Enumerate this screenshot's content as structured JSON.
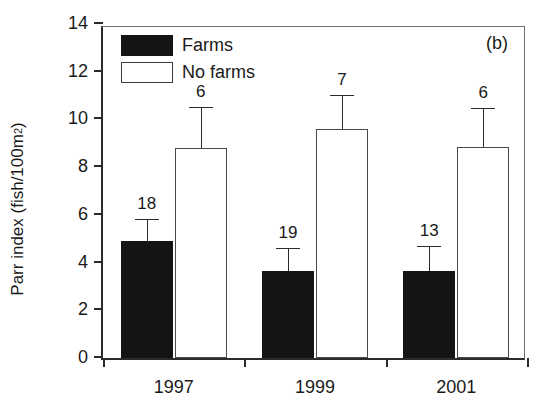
{
  "chart_data": {
    "type": "bar",
    "title": "",
    "panel_label": "(b)",
    "xlabel": "",
    "ylabel": "Parr index (fish/100m",
    "ylabel_sup": "2",
    "ylabel_suffix": ")",
    "categories": [
      "1997",
      "1999",
      "2001"
    ],
    "ylim": [
      0,
      14
    ],
    "yticks": [
      0,
      2,
      4,
      6,
      8,
      10,
      12,
      14
    ],
    "ytick_labels": [
      "0",
      "2",
      "4",
      "6",
      "8",
      "10",
      "12",
      "14"
    ],
    "grid": false,
    "legend_position": "top-left",
    "series": [
      {
        "name": "Farms",
        "color": "#141414",
        "fill": "solid",
        "values": [
          4.9,
          3.65,
          3.65
        ],
        "errors_upper": [
          0.9,
          0.9,
          1.0
        ],
        "sample_sizes": [
          18,
          19,
          13
        ],
        "sample_size_labels": [
          "18",
          "19",
          "13"
        ]
      },
      {
        "name": "No farms",
        "color": "#ffffff",
        "fill": "open",
        "values": [
          8.8,
          9.6,
          8.85
        ],
        "errors_upper": [
          1.7,
          1.4,
          1.6
        ],
        "sample_sizes": [
          6,
          7,
          6
        ],
        "sample_size_labels": [
          "6",
          "7",
          "6"
        ]
      }
    ]
  },
  "legend": {
    "items": [
      {
        "label": "Farms",
        "style": "farms"
      },
      {
        "label": "No farms",
        "style": "nofarms"
      }
    ]
  },
  "colors": {
    "farms_fill": "#141414",
    "nofarms_fill": "#ffffff",
    "axis": "#2b2b2b",
    "background": "#ffffff"
  }
}
